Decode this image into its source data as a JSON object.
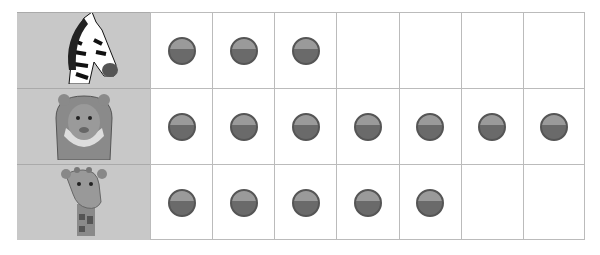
{
  "rows": [
    {
      "animal": "zebra",
      "count": 3
    },
    {
      "animal": "lion",
      "count": 7
    },
    {
      "animal": "giraffe",
      "count": 5
    }
  ],
  "columns": 7
}
